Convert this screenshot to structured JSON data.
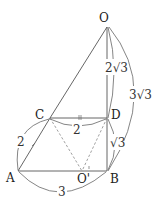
{
  "diagram": {
    "points": {
      "O": {
        "label": "O",
        "x": 107,
        "y": 27
      },
      "C": {
        "label": "C",
        "x": 50,
        "y": 118
      },
      "D": {
        "label": "D",
        "x": 107,
        "y": 118
      },
      "A": {
        "label": "A",
        "x": 18,
        "y": 171
      },
      "B": {
        "label": "B",
        "x": 107,
        "y": 171
      },
      "O_prime": {
        "label": "O'",
        "x": 82,
        "y": 171
      }
    },
    "lengths": {
      "OD": "2√3",
      "OB": "3√3",
      "AC": "2",
      "CD": "2",
      "DB": "√3",
      "AB": "3"
    },
    "colors": {
      "line": "#555555",
      "dashed": "#888888",
      "text": "#222222"
    }
  }
}
